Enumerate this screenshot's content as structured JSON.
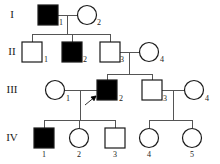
{
  "figure": {
    "type": "pedigree-chart",
    "title": "",
    "width": 220,
    "height": 164,
    "background_color": "#ffffff",
    "line_color": "#555555",
    "symbol_stroke_color": "#1a1a1a",
    "affected_fill": "#000000",
    "unaffected_fill": "#ffffff"
  },
  "generations": [
    {
      "label": "I",
      "y": 15,
      "label_x": 12
    },
    {
      "label": "II",
      "y": 52,
      "label_x": 12
    },
    {
      "label": "III",
      "y": 90,
      "label_x": 12
    },
    {
      "label": "IV",
      "y": 138,
      "label_x": 12
    }
  ],
  "individuals": [
    {
      "id": "I-1",
      "number": "1",
      "sex": "male",
      "shape": "square",
      "affected": true,
      "cx": 48,
      "cy": 15,
      "num_x": 61,
      "num_y": 23
    },
    {
      "id": "I-2",
      "number": "2",
      "sex": "female",
      "shape": "circle",
      "affected": false,
      "cx": 87,
      "cy": 15,
      "num_x": 99,
      "num_y": 23
    },
    {
      "id": "II-1",
      "number": "1",
      "sex": "male",
      "shape": "square",
      "affected": false,
      "cx": 32,
      "cy": 52,
      "num_x": 46,
      "num_y": 60
    },
    {
      "id": "II-2",
      "number": "2",
      "sex": "male",
      "shape": "square",
      "affected": true,
      "cx": 72,
      "cy": 52,
      "num_x": 85,
      "num_y": 60
    },
    {
      "id": "II-3",
      "number": "3",
      "sex": "male",
      "shape": "square",
      "affected": false,
      "cx": 110,
      "cy": 52,
      "num_x": 122,
      "num_y": 60
    },
    {
      "id": "II-4",
      "number": "4",
      "sex": "female",
      "shape": "circle",
      "affected": false,
      "cx": 149,
      "cy": 52,
      "num_x": 162,
      "num_y": 60
    },
    {
      "id": "III-1",
      "number": "1",
      "sex": "female",
      "shape": "circle",
      "affected": false,
      "cx": 55,
      "cy": 90,
      "num_x": 68,
      "num_y": 99
    },
    {
      "id": "III-2",
      "number": "2",
      "sex": "male",
      "shape": "square",
      "affected": true,
      "cx": 107,
      "cy": 90,
      "num_x": 121,
      "num_y": 99
    },
    {
      "id": "III-3",
      "number": "3",
      "sex": "male",
      "shape": "square",
      "affected": false,
      "cx": 152,
      "cy": 90,
      "num_x": 165,
      "num_y": 99
    },
    {
      "id": "III-4",
      "number": "4",
      "sex": "female",
      "shape": "circle",
      "affected": false,
      "cx": 194,
      "cy": 90,
      "num_x": 207,
      "num_y": 99
    },
    {
      "id": "IV-1",
      "number": "1",
      "sex": "male",
      "shape": "square",
      "affected": true,
      "cx": 44,
      "cy": 138,
      "num_x": 44,
      "num_y": 155
    },
    {
      "id": "IV-2",
      "number": "2",
      "sex": "female",
      "shape": "circle",
      "affected": false,
      "cx": 79,
      "cy": 138,
      "num_x": 79,
      "num_y": 155
    },
    {
      "id": "IV-3",
      "number": "3",
      "sex": "male",
      "shape": "square",
      "affected": false,
      "cx": 115,
      "cy": 138,
      "num_x": 115,
      "num_y": 155
    },
    {
      "id": "IV-4",
      "number": "4",
      "sex": "female",
      "shape": "circle",
      "affected": false,
      "cx": 149,
      "cy": 138,
      "num_x": 149,
      "num_y": 155
    },
    {
      "id": "IV-5",
      "number": "5",
      "sex": "female",
      "shape": "circle",
      "affected": false,
      "cx": 192,
      "cy": 138,
      "num_x": 192,
      "num_y": 155
    }
  ],
  "symbol_size": {
    "square": 20,
    "circle_r": 9.5
  },
  "connections": {
    "mating_lines": [
      {
        "name": "I-1-x-I-2",
        "x1": 58,
        "x2": 77,
        "y": 15
      },
      {
        "name": "II-3-x-II-4",
        "x1": 120,
        "x2": 139,
        "y": 52
      },
      {
        "name": "III-1-x-III-2",
        "x1": 64,
        "x2": 97,
        "y": 90
      },
      {
        "name": "III-3-x-III-4",
        "x1": 162,
        "x2": 184,
        "y": 90
      }
    ],
    "descent_drops": [
      {
        "name": "drop-gen1-to-sibship2",
        "x": 67,
        "y1": 15,
        "y2": 34
      },
      {
        "name": "drop-gen2-to-sibship3",
        "x": 129,
        "y1": 52,
        "y2": 74
      },
      {
        "name": "drop-gen3L-to-sibship4",
        "x": 80,
        "y1": 90,
        "y2": 120
      },
      {
        "name": "drop-gen3R-to-sibship4",
        "x": 173,
        "y1": 90,
        "y2": 120
      }
    ],
    "sibship_bars": [
      {
        "name": "sibship-gen2",
        "x1": 32,
        "x2": 110,
        "y": 34,
        "children_x": [
          32,
          72,
          110
        ],
        "child_top": 42
      },
      {
        "name": "sibship-gen3",
        "x1": 107,
        "x2": 152,
        "y": 74,
        "children_x": [
          107,
          152
        ],
        "child_top": 80
      },
      {
        "name": "sibship-gen4-left",
        "x1": 44,
        "x2": 115,
        "y": 120,
        "children_x": [
          44,
          79,
          115
        ],
        "child_top": 128
      },
      {
        "name": "sibship-gen4-right",
        "x1": 149,
        "x2": 192,
        "y": 120,
        "children_x": [
          149,
          192
        ],
        "child_top": 128
      }
    ]
  },
  "proband": {
    "indicated_individual": "III-2",
    "arrow_tail": {
      "x": 85,
      "y": 105
    },
    "arrow_head": {
      "x": 96,
      "y": 96
    },
    "description": "arrow pointing to III-2"
  }
}
